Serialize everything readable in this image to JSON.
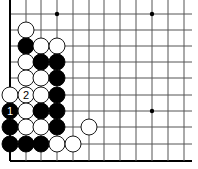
{
  "diagram": {
    "type": "go-board-problem",
    "grid": {
      "columns_x": [
        10,
        26,
        41,
        57,
        73,
        89,
        104,
        120,
        136,
        152,
        168,
        184
      ],
      "rows_y": [
        14,
        30,
        46,
        62,
        78,
        95,
        111,
        127,
        144,
        161
      ],
      "line_right_extent": 192,
      "line_top_extent": 0,
      "edges": [
        "left",
        "bottom"
      ],
      "line_color": "#555555",
      "edge_color": "#000000"
    },
    "star_points": [
      {
        "col": 3,
        "row": 0
      },
      {
        "col": 9,
        "row": 0
      },
      {
        "col": 9,
        "row": 6
      }
    ],
    "stone_radius": 8,
    "colors": {
      "black": "#000000",
      "white": "#ffffff",
      "stone_outline": "#000000"
    },
    "stones": [
      {
        "color": "white",
        "col": 1,
        "row": 1
      },
      {
        "color": "black",
        "col": 1,
        "row": 2
      },
      {
        "color": "white",
        "col": 2,
        "row": 2
      },
      {
        "color": "white",
        "col": 3,
        "row": 2
      },
      {
        "color": "white",
        "col": 1,
        "row": 3
      },
      {
        "color": "black",
        "col": 2,
        "row": 3
      },
      {
        "color": "black",
        "col": 3,
        "row": 3
      },
      {
        "color": "white",
        "col": 1,
        "row": 4
      },
      {
        "color": "white",
        "col": 2,
        "row": 4
      },
      {
        "color": "black",
        "col": 3,
        "row": 4
      },
      {
        "color": "white",
        "col": 0,
        "row": 5
      },
      {
        "color": "white",
        "col": 1,
        "row": 5,
        "label": "2"
      },
      {
        "color": "white",
        "col": 2,
        "row": 5
      },
      {
        "color": "black",
        "col": 3,
        "row": 5
      },
      {
        "color": "black",
        "col": 0,
        "row": 6,
        "label": "1"
      },
      {
        "color": "white",
        "col": 1,
        "row": 6
      },
      {
        "color": "black",
        "col": 2,
        "row": 6
      },
      {
        "color": "black",
        "col": 3,
        "row": 6
      },
      {
        "color": "black",
        "col": 0,
        "row": 7
      },
      {
        "color": "white",
        "col": 1,
        "row": 7
      },
      {
        "color": "white",
        "col": 2,
        "row": 7
      },
      {
        "color": "black",
        "col": 3,
        "row": 7
      },
      {
        "color": "white",
        "col": 5,
        "row": 7
      },
      {
        "color": "black",
        "col": 0,
        "row": 8
      },
      {
        "color": "black",
        "col": 1,
        "row": 8
      },
      {
        "color": "black",
        "col": 2,
        "row": 8
      },
      {
        "color": "white",
        "col": 3,
        "row": 8
      },
      {
        "color": "white",
        "col": 4,
        "row": 8
      }
    ]
  }
}
